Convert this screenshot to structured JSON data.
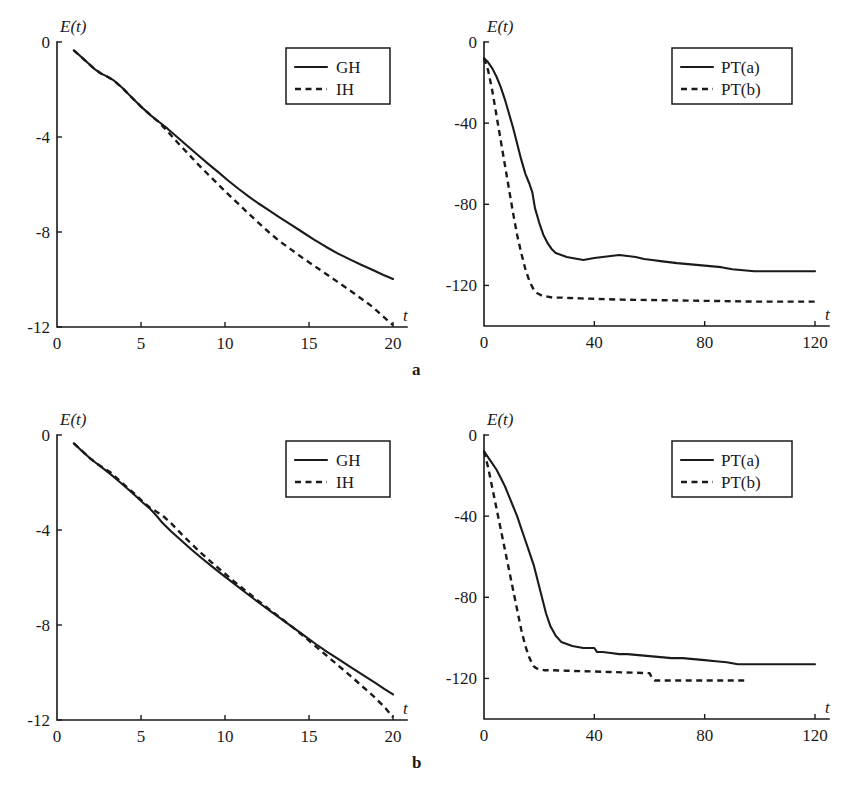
{
  "figure": {
    "subfigure_labels": [
      "a",
      "b"
    ],
    "background_color": "#ffffff",
    "ink_color": "#1a1a1a"
  },
  "chart_data": [
    {
      "id": "panel-a-left",
      "type": "line",
      "title": "",
      "xlabel": "t",
      "ylabel": "E(t)",
      "xlim": [
        0,
        20
      ],
      "ylim": [
        -12,
        0
      ],
      "xticks": [
        0,
        5,
        10,
        15,
        20
      ],
      "yticks": [
        0,
        -4,
        -8,
        -12
      ],
      "xtick_labels": [
        "0",
        "5",
        "10",
        "15",
        "20"
      ],
      "ytick_labels": [
        "0",
        "-4",
        "-8",
        "-12"
      ],
      "grid": false,
      "legend_position": "upper right",
      "legend_entries": [
        "GH",
        "IH"
      ],
      "series": [
        {
          "name": "GH",
          "style": "solid",
          "x": [
            1.0,
            1.6,
            2.2,
            2.6,
            3.0,
            3.4,
            3.9,
            4.4,
            5.0,
            5.6,
            6.1,
            6.6,
            7.2,
            7.8,
            8.4,
            9.0,
            9.6,
            10.2,
            10.8,
            11.4,
            12.0,
            12.6,
            13.2,
            13.9,
            14.6,
            15.3,
            16.0,
            16.7,
            17.4,
            18.1,
            18.8,
            19.4,
            20.0
          ],
          "y": [
            -0.35,
            -0.73,
            -1.12,
            -1.32,
            -1.46,
            -1.63,
            -1.94,
            -2.3,
            -2.72,
            -3.1,
            -3.38,
            -3.66,
            -4.03,
            -4.4,
            -4.77,
            -5.13,
            -5.48,
            -5.84,
            -6.18,
            -6.5,
            -6.8,
            -7.08,
            -7.36,
            -7.68,
            -8.0,
            -8.32,
            -8.62,
            -8.9,
            -9.14,
            -9.38,
            -9.6,
            -9.8,
            -9.98
          ]
        },
        {
          "name": "IH",
          "style": "dashed",
          "x": [
            1.0,
            1.6,
            2.2,
            2.6,
            3.0,
            3.4,
            3.9,
            4.4,
            5.0,
            5.6,
            6.1,
            6.6,
            7.2,
            7.8,
            8.4,
            9.0,
            9.6,
            10.2,
            10.8,
            11.4,
            12.0,
            12.6,
            13.2,
            13.9,
            14.6,
            15.3,
            16.0,
            16.7,
            17.4,
            18.1,
            18.8,
            19.4,
            20.0
          ],
          "y": [
            -0.35,
            -0.73,
            -1.12,
            -1.32,
            -1.46,
            -1.63,
            -1.94,
            -2.3,
            -2.72,
            -3.1,
            -3.4,
            -3.78,
            -4.25,
            -4.7,
            -5.15,
            -5.58,
            -6.0,
            -6.42,
            -6.82,
            -7.22,
            -7.62,
            -8.0,
            -8.36,
            -8.72,
            -9.08,
            -9.42,
            -9.76,
            -10.1,
            -10.44,
            -10.8,
            -11.16,
            -11.55,
            -11.92
          ]
        }
      ]
    },
    {
      "id": "panel-a-right",
      "type": "line",
      "title": "",
      "xlabel": "t",
      "ylabel": "E(t)",
      "xlim": [
        0,
        120
      ],
      "ylim": [
        -140,
        0
      ],
      "xticks": [
        0,
        40,
        80,
        120
      ],
      "yticks": [
        0,
        -40,
        -80,
        -120
      ],
      "xtick_labels": [
        "0",
        "40",
        "80",
        "120"
      ],
      "ytick_labels": [
        "0",
        "-40",
        "-80",
        "-120"
      ],
      "grid": false,
      "legend_position": "upper right",
      "legend_entries": [
        "PT(a)",
        "PT(b)"
      ],
      "series": [
        {
          "name": "PT(a)",
          "style": "solid",
          "x": [
            0,
            1.5,
            3,
            4.5,
            6,
            7.5,
            9,
            10.5,
            12,
            13.5,
            15,
            16.5,
            17.5,
            18.5,
            20,
            21.5,
            23,
            24.5,
            26,
            28,
            30,
            32,
            34,
            36,
            38,
            40,
            43,
            46,
            49,
            52,
            55,
            58,
            61,
            64,
            67,
            70,
            74,
            78,
            82,
            86,
            90,
            94,
            98,
            104,
            110,
            116,
            120
          ],
          "y": [
            -8,
            -10,
            -13,
            -17,
            -22,
            -28,
            -35,
            -42,
            -50,
            -58,
            -65,
            -70,
            -74,
            -82,
            -89,
            -95,
            -99,
            -102,
            -104,
            -105,
            -106,
            -106.5,
            -107,
            -107.5,
            -107,
            -106.5,
            -106,
            -105.5,
            -105,
            -105.5,
            -106,
            -107,
            -107.5,
            -108,
            -108.5,
            -109,
            -109.5,
            -110,
            -110.5,
            -111,
            -112,
            -112.5,
            -113,
            -113,
            -113,
            -113,
            -113
          ]
        },
        {
          "name": "PT(b)",
          "style": "dashed",
          "x": [
            0,
            1.5,
            3,
            4.5,
            6,
            7.5,
            9,
            10.5,
            12,
            13.5,
            15,
            16.5,
            18,
            19.5,
            21,
            23,
            25,
            28,
            31,
            35,
            40,
            45,
            50,
            55,
            60,
            65,
            70,
            75,
            80,
            85,
            90,
            95,
            100,
            106,
            112,
            118,
            120
          ],
          "y": [
            -8,
            -14,
            -24,
            -36,
            -48,
            -60,
            -72,
            -84,
            -95,
            -104,
            -112,
            -118,
            -122,
            -124,
            -125,
            -125.5,
            -126,
            -126,
            -126.2,
            -126.4,
            -126.6,
            -126.8,
            -127,
            -127.1,
            -127.2,
            -127.3,
            -127.4,
            -127.5,
            -127.6,
            -127.7,
            -127.8,
            -127.9,
            -128,
            -128,
            -128,
            -128,
            -128
          ]
        }
      ]
    },
    {
      "id": "panel-b-left",
      "type": "line",
      "title": "",
      "xlabel": "t",
      "ylabel": "E(t)",
      "xlim": [
        0,
        20
      ],
      "ylim": [
        -12,
        0
      ],
      "xticks": [
        0,
        5,
        10,
        15,
        20
      ],
      "yticks": [
        0,
        -4,
        -8,
        -12
      ],
      "xtick_labels": [
        "0",
        "5",
        "10",
        "15",
        "20"
      ],
      "ytick_labels": [
        "0",
        "-4",
        "-8",
        "-12"
      ],
      "grid": false,
      "legend_position": "upper right",
      "legend_entries": [
        "GH",
        "IH"
      ],
      "series": [
        {
          "name": "GH",
          "style": "solid",
          "x": [
            1.0,
            1.5,
            2.0,
            2.4,
            2.8,
            3.2,
            3.7,
            4.2,
            4.7,
            5.1,
            5.5,
            5.9,
            6.3,
            6.8,
            7.4,
            8.0,
            8.6,
            9.2,
            9.8,
            10.5,
            11.2,
            11.9,
            12.6,
            13.3,
            14.0,
            14.7,
            15.4,
            16.1,
            16.8,
            17.5,
            18.2,
            18.9,
            19.5,
            20.0
          ],
          "y": [
            -0.35,
            -0.68,
            -1.0,
            -1.22,
            -1.44,
            -1.66,
            -1.96,
            -2.26,
            -2.58,
            -2.84,
            -3.08,
            -3.38,
            -3.72,
            -4.06,
            -4.44,
            -4.82,
            -5.18,
            -5.52,
            -5.86,
            -6.24,
            -6.62,
            -7.0,
            -7.36,
            -7.72,
            -8.08,
            -8.44,
            -8.8,
            -9.14,
            -9.46,
            -9.78,
            -10.1,
            -10.42,
            -10.7,
            -10.92
          ]
        },
        {
          "name": "IH",
          "style": "dashed",
          "x": [
            1.0,
            1.5,
            2.0,
            2.4,
            2.8,
            3.2,
            3.7,
            4.2,
            4.7,
            5.1,
            5.5,
            5.9,
            6.3,
            6.8,
            7.4,
            8.0,
            8.6,
            9.2,
            9.8,
            10.5,
            11.2,
            11.9,
            12.6,
            13.3,
            14.0,
            14.7,
            15.4,
            16.1,
            16.8,
            17.5,
            18.2,
            18.9,
            19.5,
            20.0
          ],
          "y": [
            -0.35,
            -0.68,
            -1.0,
            -1.22,
            -1.4,
            -1.58,
            -1.9,
            -2.22,
            -2.52,
            -2.8,
            -3.04,
            -3.22,
            -3.4,
            -3.72,
            -4.16,
            -4.58,
            -4.98,
            -5.36,
            -5.72,
            -6.14,
            -6.54,
            -6.94,
            -7.32,
            -7.7,
            -8.08,
            -8.48,
            -8.9,
            -9.32,
            -9.74,
            -10.16,
            -10.6,
            -11.04,
            -11.46,
            -11.88
          ]
        }
      ]
    },
    {
      "id": "panel-b-right",
      "type": "line",
      "title": "",
      "xlabel": "t",
      "ylabel": "E(t)",
      "xlim": [
        0,
        120
      ],
      "ylim": [
        -140,
        0
      ],
      "xticks": [
        0,
        40,
        80,
        120
      ],
      "yticks": [
        0,
        -40,
        -80,
        -120
      ],
      "xtick_labels": [
        "0",
        "40",
        "80",
        "120"
      ],
      "ytick_labels": [
        "0",
        "-40",
        "-80",
        "-120"
      ],
      "grid": false,
      "legend_position": "upper right",
      "legend_entries": [
        "PT(a)",
        "PT(b)"
      ],
      "series": [
        {
          "name": "PT(a)",
          "style": "solid",
          "x": [
            0,
            1.5,
            3,
            4.5,
            6,
            7.5,
            9,
            10.5,
            12,
            13.5,
            15,
            16.5,
            18,
            19.5,
            21,
            22.5,
            24,
            26,
            28,
            30,
            32,
            34,
            36,
            38,
            40,
            41,
            43,
            46,
            49,
            52,
            56,
            60,
            64,
            68,
            72,
            76,
            80,
            84,
            88,
            92,
            96,
            102,
            108,
            114,
            120
          ],
          "y": [
            -8,
            -11,
            -14,
            -17,
            -21,
            -25,
            -30,
            -35,
            -40,
            -46,
            -52,
            -58,
            -64,
            -72,
            -80,
            -88,
            -94,
            -99,
            -102,
            -103,
            -104,
            -104.5,
            -105,
            -105,
            -105,
            -107,
            -107,
            -107.5,
            -108,
            -108,
            -108.5,
            -109,
            -109.5,
            -110,
            -110,
            -110.5,
            -111,
            -111.5,
            -112,
            -113,
            -113,
            -113,
            -113,
            -113,
            -113
          ]
        },
        {
          "name": "PT(b)",
          "style": "dashed",
          "x": [
            0,
            1.5,
            3,
            4.5,
            6,
            7.5,
            9,
            10.5,
            12,
            13.5,
            15,
            16.5,
            18,
            19,
            20,
            22,
            25,
            30,
            35,
            40,
            45,
            50,
            55,
            60,
            61,
            62,
            65,
            70,
            75,
            80,
            85,
            90,
            95
          ],
          "y": [
            -8,
            -16,
            -26,
            -36,
            -46,
            -56,
            -66,
            -76,
            -86,
            -96,
            -104,
            -110,
            -114,
            -115,
            -115.5,
            -116,
            -116,
            -116.2,
            -116.4,
            -116.6,
            -116.8,
            -117,
            -117.2,
            -117.4,
            -120,
            -121,
            -121,
            -121,
            -121,
            -121,
            -121,
            -121,
            -121
          ]
        }
      ]
    }
  ]
}
